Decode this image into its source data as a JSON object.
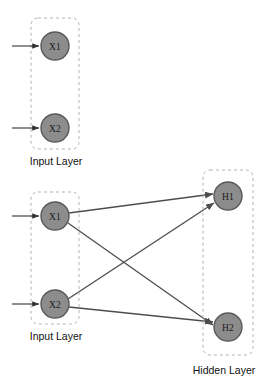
{
  "diagram": {
    "type": "neural-network",
    "title": "",
    "background_color": "#ffffff",
    "node_fill_color": "#8c8c8c",
    "node_stroke_color": "#595959",
    "edge_color": "#4d4d4d",
    "box_stroke_color": "#b3b3b3",
    "groups": [
      {
        "id": "input-group-top",
        "caption": "Input Layer",
        "box": {
          "x": 31,
          "y": 18,
          "width": 48,
          "height": 131
        },
        "caption_pos": {
          "x": 56,
          "y": 162
        },
        "nodes": [
          {
            "id": "x1-top",
            "label": "X1",
            "cx": 55,
            "cy": 46,
            "r": 14
          },
          {
            "id": "x2-top",
            "label": "X2",
            "cx": 55,
            "cy": 128,
            "r": 14
          }
        ],
        "input_arrows": [
          {
            "x1": 12,
            "y1": 46,
            "x2": 39,
            "y2": 46
          },
          {
            "x1": 12,
            "y1": 128,
            "x2": 39,
            "y2": 128
          }
        ]
      },
      {
        "id": "input-group-bottom",
        "caption": "Input Layer",
        "box": {
          "x": 31,
          "y": 192,
          "width": 48,
          "height": 132
        },
        "caption_pos": {
          "x": 56,
          "y": 337
        },
        "nodes": [
          {
            "id": "x1-bottom",
            "label": "X1",
            "cx": 55,
            "cy": 216,
            "r": 14
          },
          {
            "id": "x2-bottom",
            "label": "X2",
            "cx": 55,
            "cy": 304,
            "r": 14
          }
        ],
        "input_arrows": [
          {
            "x1": 12,
            "y1": 216,
            "x2": 39,
            "y2": 216
          },
          {
            "x1": 12,
            "y1": 304,
            "x2": 39,
            "y2": 304
          }
        ]
      },
      {
        "id": "hidden-group",
        "caption": "Hidden Layer",
        "box": {
          "x": 203,
          "y": 170,
          "width": 50,
          "height": 185
        },
        "caption_pos": {
          "x": 224,
          "y": 371
        },
        "nodes": [
          {
            "id": "h1",
            "label": "H1",
            "cx": 228,
            "cy": 196,
            "r": 14
          },
          {
            "id": "h2",
            "label": "H2",
            "cx": 228,
            "cy": 327,
            "r": 14
          }
        ],
        "input_arrows": []
      }
    ],
    "edges": [
      {
        "id": "edge-x1-h1",
        "from": "x1-bottom",
        "to": "h1",
        "x1": 69,
        "y1": 213,
        "x2": 213,
        "y2": 194
      },
      {
        "id": "edge-x1-h2",
        "from": "x1-bottom",
        "to": "h2",
        "x1": 68,
        "y1": 223,
        "x2": 213,
        "y2": 325
      },
      {
        "id": "edge-x2-h1",
        "from": "x2-bottom",
        "to": "h1",
        "x1": 68,
        "y1": 299,
        "x2": 214,
        "y2": 203
      },
      {
        "id": "edge-x2-h2",
        "from": "x2-bottom",
        "to": "h2",
        "x1": 69,
        "y1": 307,
        "x2": 213,
        "y2": 322
      }
    ]
  }
}
